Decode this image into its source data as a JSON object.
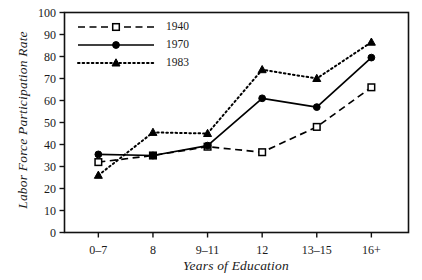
{
  "chart_data": {
    "type": "line",
    "title": "",
    "xlabel": "Years of Education",
    "ylabel": "Labor Force Participation Rate",
    "categories": [
      "0–7",
      "8",
      "9–11",
      "12",
      "13–15",
      "16+"
    ],
    "ylim": [
      0,
      100
    ],
    "ytick_labels": [
      "0",
      "10",
      "20",
      "30",
      "40",
      "50",
      "60",
      "70",
      "80",
      "90",
      "100"
    ],
    "ytick_values": [
      0,
      10,
      20,
      30,
      40,
      50,
      60,
      70,
      80,
      90,
      100
    ],
    "grid": false,
    "legend_position": "upper-left",
    "series": [
      {
        "name": "1940",
        "values": [
          32,
          35,
          39,
          36.5,
          48,
          66
        ],
        "line_style": "dashed",
        "marker": "open-square",
        "color": "#000000"
      },
      {
        "name": "1970",
        "values": [
          35.5,
          35,
          39.5,
          61,
          57,
          79.5
        ],
        "line_style": "solid",
        "marker": "filled-circle",
        "color": "#000000"
      },
      {
        "name": "1983",
        "values": [
          26,
          45.5,
          45,
          74,
          70,
          86.5
        ],
        "line_style": "dotted",
        "marker": "filled-triangle",
        "color": "#000000"
      }
    ]
  }
}
